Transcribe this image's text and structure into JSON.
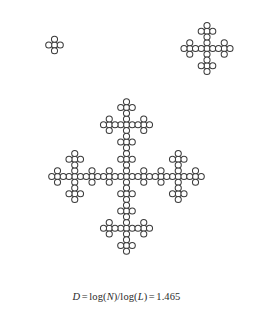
{
  "figure": {
    "kind": "vicsek-fractal-diagram",
    "background_color": "#ffffff",
    "stroke_color": "#3b3b3b",
    "fill_color": "#ffffff",
    "stroke_width": 1.05,
    "circle_radius": 3.05,
    "unit_spacing": 5.75,
    "branch_factor": 5,
    "scale_factor": 3
  },
  "pattern": {
    "name": "vicsek-cross",
    "description": "plus-shaped motif of five units: center plus four orthogonal neighbours",
    "offsets": [
      {
        "dx": 0,
        "dy": 0,
        "role": "center"
      },
      {
        "dx": 0,
        "dy": -1,
        "role": "up"
      },
      {
        "dx": 1,
        "dy": 0,
        "role": "right"
      },
      {
        "dx": 0,
        "dy": 1,
        "role": "down"
      },
      {
        "dx": -1,
        "dy": 0,
        "role": "left"
      }
    ]
  },
  "clusters": [
    {
      "id": "level-1-cluster",
      "label": "Level 1 cross",
      "iteration": 1,
      "circle_count": 5,
      "center_x": 54.5,
      "center_y": 45.0
    },
    {
      "id": "level-2-cluster",
      "label": "Level 2 cross",
      "iteration": 2,
      "circle_count": 25,
      "center_x": 207.0,
      "center_y": 48.5
    },
    {
      "id": "level-3-cluster",
      "label": "Level 3 cross",
      "iteration": 3,
      "circle_count": 125,
      "center_x": 126.5,
      "center_y": 176.5
    }
  ],
  "caption": {
    "symbol_d": "D",
    "equals_1": "=",
    "log_n": "log(",
    "var_n": "N",
    "close_n": ")/log(",
    "var_l": "L",
    "close_l": ")",
    "equals_2": "=",
    "value": "1.465",
    "full_text": "D = log(N)/log(L) = 1.465"
  }
}
